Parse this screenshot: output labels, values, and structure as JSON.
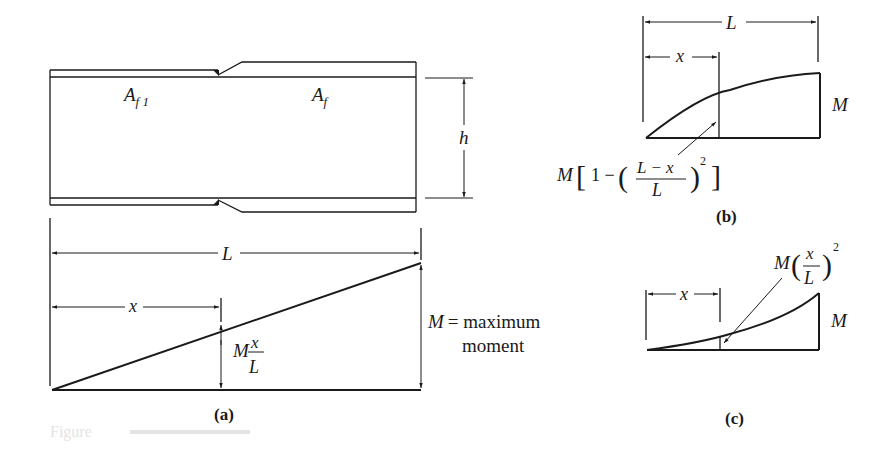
{
  "figure": {
    "panels": [
      {
        "id": "a",
        "caption": "(a)",
        "beam": {
          "label_flange_reduced": "A",
          "label_flange_reduced_sub": "f 1",
          "label_flange_full": "A",
          "label_flange_full_sub": "f",
          "depth_label": "h"
        },
        "moment_diagram": {
          "shape": "linear",
          "span_label": "L",
          "position_label": "x",
          "ordinate_label_M": "M",
          "ordinate_label_num": "x",
          "ordinate_label_den": "L",
          "max_label_M": "M",
          "max_label_eq": "= maximum",
          "max_label_line2": "moment"
        }
      },
      {
        "id": "b",
        "caption": "(b)",
        "moment_diagram": {
          "shape": "parabolic-concave-down",
          "span_label": "L",
          "position_label": "x",
          "end_label": "M",
          "formula_M": "M",
          "formula_one_minus": "1 −",
          "formula_num": "L − x",
          "formula_den": "L",
          "formula_exp": "2"
        }
      },
      {
        "id": "c",
        "caption": "(c)",
        "moment_diagram": {
          "shape": "parabolic-concave-up",
          "position_label": "x",
          "end_label": "M",
          "formula_M": "M",
          "formula_num": "x",
          "formula_den": "L",
          "formula_exp": "2"
        }
      }
    ],
    "scan_artifact_text": "Figure"
  }
}
